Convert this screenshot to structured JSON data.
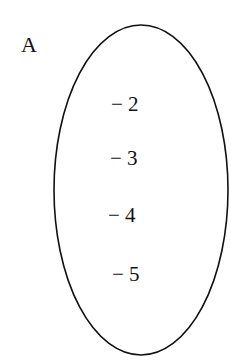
{
  "set": {
    "label": "A",
    "elements": [
      "− 2",
      "− 3",
      "− 4",
      "− 5"
    ]
  },
  "colors": {
    "stroke": "#111111",
    "background": "#ffffff"
  }
}
